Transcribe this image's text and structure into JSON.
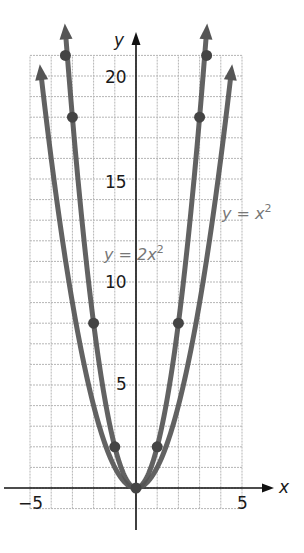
{
  "chart_data": {
    "type": "line",
    "title": "",
    "xlabel": "x",
    "ylabel": "y",
    "xlim": [
      -5,
      5
    ],
    "ylim": [
      -1,
      21
    ],
    "grid": true,
    "x_ticks": [
      -5,
      5
    ],
    "y_ticks": [
      5,
      10,
      15,
      20
    ],
    "x_tick_labels": [
      "−5",
      "5"
    ],
    "y_tick_labels": [
      "5",
      "10",
      "15",
      "20"
    ],
    "series": [
      {
        "name": "y = x²",
        "label_text": "y = x",
        "label_sup": "2",
        "function": "x^2",
        "x_range": [
          -4.45,
          4.45
        ],
        "points": []
      },
      {
        "name": "y = 2x²",
        "label_text": "y = 2x",
        "label_sup": "2",
        "function": "2x^2",
        "x_range": [
          -3.3,
          3.3
        ],
        "points": [
          [
            -3.33,
            21
          ],
          [
            -3,
            18
          ],
          [
            -2,
            8
          ],
          [
            -1,
            2
          ],
          [
            0,
            0
          ],
          [
            1,
            2
          ],
          [
            2,
            8
          ],
          [
            3,
            18
          ],
          [
            3.33,
            21
          ]
        ]
      }
    ],
    "colors": {
      "curve": "#555555",
      "grid": "#b5b5b5",
      "axis": "#111111",
      "label": "#777777"
    }
  }
}
